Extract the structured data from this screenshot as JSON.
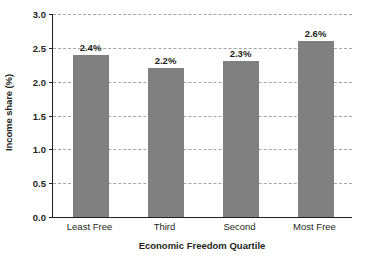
{
  "chart_data": {
    "type": "bar",
    "title": "",
    "subtitle": "",
    "xlabel": "Economic Freedom Quartile",
    "ylabel": "Income share (%)",
    "categories": [
      "Least Free",
      "Third",
      "Second",
      "Most Free"
    ],
    "values": [
      2.4,
      2.2,
      2.3,
      2.6
    ],
    "value_labels": [
      "2.4%",
      "2.2%",
      "2.3%",
      "2.6%"
    ],
    "ylim": [
      0.0,
      3.0
    ],
    "ytick_values": [
      3.0,
      2.5,
      2.0,
      1.5,
      1.0,
      0.5,
      0.0
    ],
    "ytick_labels": [
      "3.0",
      "2.5",
      "2.0",
      "1.5",
      "1.0",
      "0.5",
      "0.0"
    ],
    "grid": "horizontal-dashed",
    "legend": "none",
    "legend_position": "none",
    "series": [
      {
        "name": "Income share",
        "values": [
          2.4,
          2.2,
          2.3,
          2.6
        ]
      }
    ],
    "colors": {
      "bar_fill": "#808080",
      "gridline": "#a6a6a6",
      "axis_line": "#231f20",
      "text": "#231f20",
      "background": "#ffffff"
    }
  }
}
